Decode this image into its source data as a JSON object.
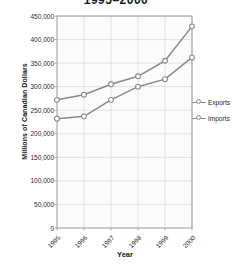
{
  "chart_data": {
    "type": "line",
    "title": "1995–2000",
    "xlabel": "Year",
    "ylabel": "Millions of Canadian Dollars",
    "categories": [
      "1995",
      "1996",
      "1997",
      "1998",
      "1999",
      "2000"
    ],
    "ylim": [
      0,
      450000
    ],
    "yticks": [
      "0",
      "50,000",
      "100,000",
      "150,000",
      "200,000",
      "250,000",
      "300,000",
      "350,000",
      "400,000",
      "450,000"
    ],
    "ytick_values": [
      0,
      50000,
      100000,
      150000,
      200000,
      250000,
      300000,
      350000,
      400000,
      450000
    ],
    "grid": true,
    "legend_position": "right",
    "series": [
      {
        "name": "Exports",
        "marker": "open-circle",
        "color": "#8a8a8a",
        "values": [
          232000,
          237000,
          272000,
          300000,
          316000,
          362000
        ]
      },
      {
        "name": "Imports",
        "marker": "open-circle",
        "color": "#8a8a8a",
        "values": [
          272000,
          283000,
          305000,
          322000,
          355000,
          428000
        ]
      }
    ]
  },
  "legend": {
    "items": [
      {
        "label": "Exports"
      },
      {
        "label": "Imports"
      }
    ]
  },
  "colors": {
    "line": "#8a8a8a",
    "grid": "#d8d8d8",
    "frame": "#9a9a9a",
    "text": "#1f1f1f",
    "plot_background": "#fbfbfb"
  }
}
